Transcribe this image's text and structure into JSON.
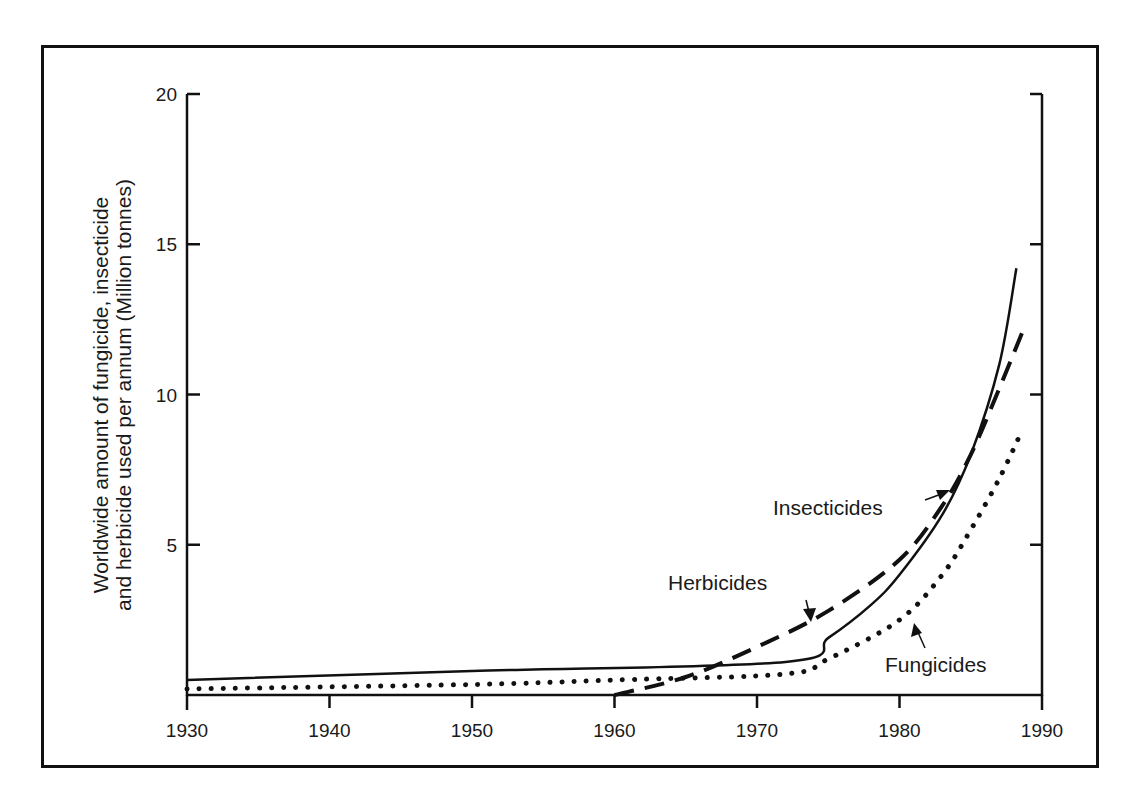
{
  "chart_data": {
    "type": "line",
    "title": "",
    "xlabel": "",
    "ylabel": "Worldwide amount of fungicide, insecticide and herbicide used per annum (Million tonnes)",
    "ylabel_lines": [
      "Worldwide amount of fungicide, insecticide",
      "and herbicide used per annum (Million tonnes)"
    ],
    "xlim": [
      1930,
      1990
    ],
    "ylim": [
      0,
      20
    ],
    "x_ticks": [
      "1930",
      "1940",
      "1950",
      "1960",
      "1970",
      "1980",
      "1990"
    ],
    "y_ticks": [
      "5",
      "10",
      "15",
      "20"
    ],
    "grid": false,
    "legend": "inline annotations with arrows",
    "series": [
      {
        "name": "Insecticides",
        "style": "solid",
        "x": [
          1930,
          1950,
          1972,
          1975,
          1978,
          1980,
          1983,
          1985,
          1987,
          1988.2
        ],
        "values": [
          0.5,
          0.8,
          1.1,
          1.9,
          3.0,
          4.0,
          6.0,
          8.0,
          11.0,
          14.2
        ]
      },
      {
        "name": "Herbicides",
        "style": "dashed",
        "x": [
          1960,
          1965,
          1970,
          1975,
          1980,
          1983,
          1985,
          1987,
          1988.6
        ],
        "values": [
          0.0,
          0.6,
          1.6,
          2.8,
          4.5,
          6.3,
          8.0,
          10.2,
          12.05
        ]
      },
      {
        "name": "Fungicides",
        "style": "dotted",
        "x": [
          1930,
          1950,
          1960,
          1972,
          1975,
          1980,
          1983,
          1985,
          1987,
          1988.6
        ],
        "values": [
          0.2,
          0.35,
          0.5,
          0.7,
          1.2,
          2.5,
          4.0,
          5.5,
          7.2,
          8.8
        ]
      }
    ],
    "annotations": [
      {
        "text": "Insecticides",
        "points_to": "Insecticides"
      },
      {
        "text": "Herbicides",
        "points_to": "Herbicides"
      },
      {
        "text": "Fungicides",
        "points_to": "Fungicides"
      }
    ]
  },
  "labels": {
    "ylabel_line1": "Worldwide amount of fungicide, insecticide",
    "ylabel_line2": "and herbicide used per annum (Million tonnes)",
    "x_ticks": [
      "1930",
      "1940",
      "1950",
      "1960",
      "1970",
      "1980",
      "1990"
    ],
    "y_ticks": [
      "5",
      "10",
      "15",
      "20"
    ],
    "insecticides": "Insecticides",
    "herbicides": "Herbicides",
    "fungicides": "Fungicides"
  }
}
